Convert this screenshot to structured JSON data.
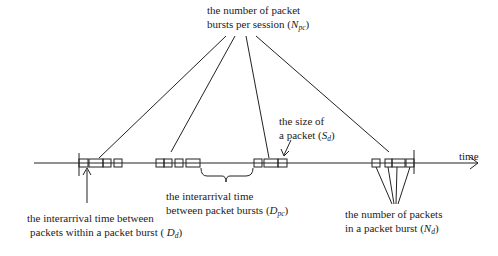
{
  "diagram": {
    "axis_label": "time",
    "labels": {
      "npc": {
        "line1": "the number of packet",
        "line2_prefix": "bursts per session (",
        "symbol": "N",
        "sub": "pc",
        "suffix": ")"
      },
      "sd": {
        "line1": "the size of",
        "line2_prefix": "a packet (",
        "symbol": "S",
        "sub": "d",
        "suffix": ")"
      },
      "dpc": {
        "line1": "the interarrival time",
        "line2_prefix": "between packet bursts (",
        "symbol": "D",
        "sub": "pc",
        "suffix": ")"
      },
      "dd": {
        "line1": "the interarrival time between",
        "line2_prefix": "packets within a packet burst ( ",
        "symbol": "D",
        "sub": "d",
        "suffix": ")"
      },
      "nd": {
        "line1": "the number of packets",
        "line2_prefix": "in a packet burst (",
        "symbol": "N",
        "sub": "d",
        "suffix": ")"
      }
    },
    "bursts": [
      {
        "name": "burst-1",
        "packets": 4
      },
      {
        "name": "burst-2",
        "packets": 4
      },
      {
        "name": "burst-3",
        "packets": 3
      },
      {
        "name": "burst-4",
        "packets": 4
      }
    ],
    "colors": {
      "ink": "#222222",
      "background": "#ffffff"
    }
  }
}
